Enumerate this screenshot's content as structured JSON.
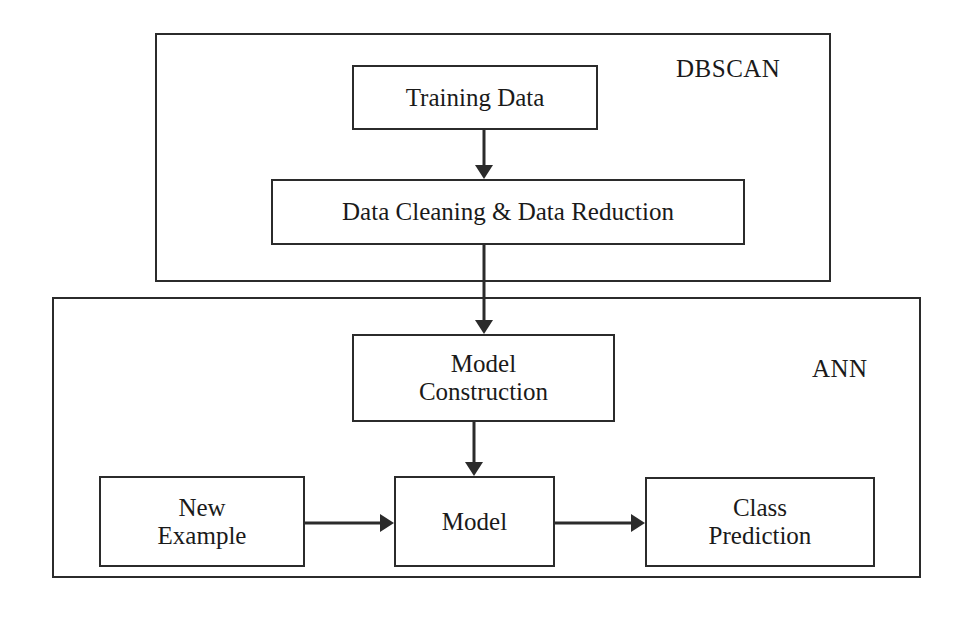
{
  "diagram": {
    "groups": [
      {
        "id": "dbscan",
        "label": "DBSCAN",
        "x": 155,
        "y": 33,
        "w": 676,
        "h": 249,
        "label_x": 676,
        "label_y": 56
      },
      {
        "id": "ann",
        "label": "ANN",
        "x": 52,
        "y": 297,
        "w": 869,
        "h": 281,
        "label_x": 812,
        "label_y": 356
      }
    ],
    "nodes": [
      {
        "id": "training-data",
        "label": "Training Data",
        "x": 352,
        "y": 65,
        "w": 246,
        "h": 65
      },
      {
        "id": "data-cleaning",
        "label": "Data Cleaning & Data Reduction",
        "x": 271,
        "y": 179,
        "w": 474,
        "h": 66
      },
      {
        "id": "model-construction",
        "label": "Model\nConstruction",
        "x": 352,
        "y": 334,
        "w": 263,
        "h": 88
      },
      {
        "id": "new-example",
        "label": "New\nExample",
        "x": 99,
        "y": 476,
        "w": 206,
        "h": 91
      },
      {
        "id": "model",
        "label": "Model",
        "x": 394,
        "y": 476,
        "w": 161,
        "h": 91
      },
      {
        "id": "class-prediction",
        "label": "Class\nPrediction",
        "x": 645,
        "y": 477,
        "w": 230,
        "h": 90
      }
    ],
    "connectors": [
      {
        "id": "training-to-cleaning",
        "from": "training-data",
        "to": "data-cleaning",
        "dir": "down",
        "x1": 484,
        "y1": 130,
        "x2": 484,
        "y2": 179
      },
      {
        "id": "cleaning-to-construction",
        "from": "data-cleaning",
        "to": "model-construction",
        "dir": "down",
        "x1": 484,
        "y1": 245,
        "x2": 484,
        "y2": 334
      },
      {
        "id": "construction-to-model",
        "from": "model-construction",
        "to": "model",
        "dir": "down",
        "x1": 474,
        "y1": 422,
        "x2": 474,
        "y2": 476
      },
      {
        "id": "example-to-model",
        "from": "new-example",
        "to": "model",
        "dir": "right",
        "x1": 305,
        "y1": 523,
        "x2": 394,
        "y2": 523
      },
      {
        "id": "model-to-prediction",
        "from": "model",
        "to": "class-prediction",
        "dir": "right",
        "x1": 555,
        "y1": 523,
        "x2": 645,
        "y2": 523
      }
    ],
    "colors": {
      "stroke": "#2b2b2b",
      "text": "#1a1a1a",
      "background": "#ffffff"
    }
  }
}
